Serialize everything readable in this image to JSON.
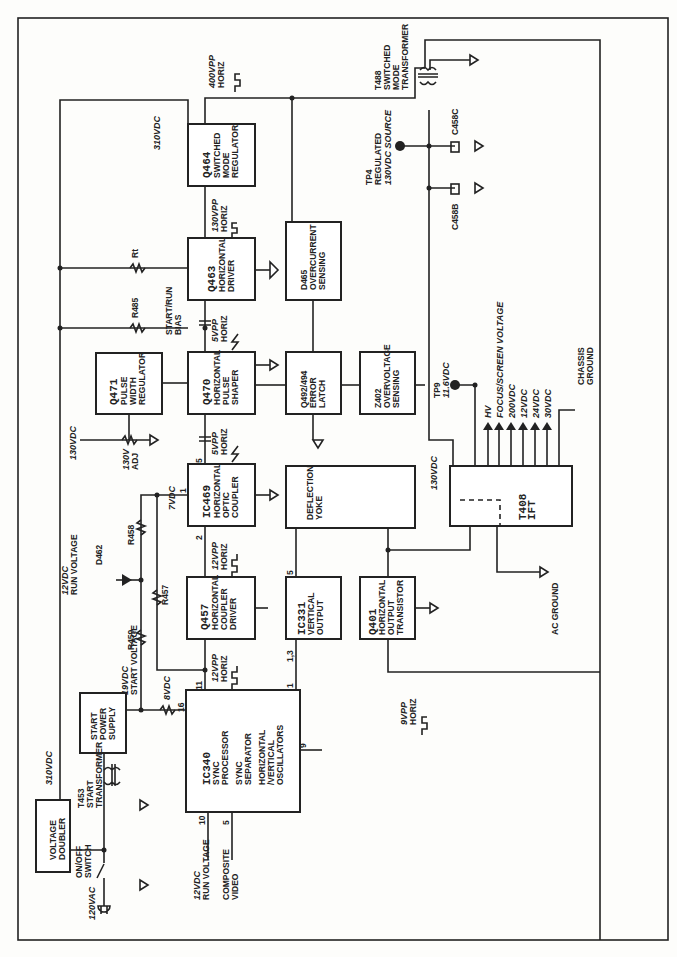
{
  "blocks": {
    "voltage_doubler": [
      "VOLTAGE",
      "DOUBLER"
    ],
    "start_power_supply": [
      "START",
      "POWER",
      "SUPPLY"
    ],
    "ic340": {
      "id": "IC340",
      "lines": [
        "SYNC",
        "PROCESSOR",
        "",
        "SYNC",
        "SEPARATOR",
        "",
        "HORIZONTAL",
        "/VERTICAL",
        "OSCILLATORS"
      ]
    },
    "q457": {
      "id": "Q457",
      "lines": [
        "HORIZONTAL",
        "COUPLER",
        "DRIVER"
      ]
    },
    "ic469": {
      "id": "IC469",
      "lines": [
        "HORIZONTAL",
        "OPTIC",
        "COUPLER"
      ]
    },
    "q471": {
      "id": "Q471",
      "lines": [
        "PULSE",
        "WIDTH",
        "REGULATOR"
      ]
    },
    "q470": {
      "id": "Q470",
      "lines": [
        "HORIZONTAL",
        "PULSE",
        "SHAPER"
      ]
    },
    "q463": {
      "id": "Q463",
      "lines": [
        "HORIZONTAL",
        "DRIVER"
      ]
    },
    "q464": {
      "id": "Q464",
      "lines": [
        "SWITCHED",
        "MODE",
        "REGULATOR"
      ]
    },
    "d465": {
      "id": "D465",
      "lines": [
        "OVERCURRENT",
        "SENSING"
      ]
    },
    "q492": {
      "id": "Q492/494",
      "lines": [
        "ERROR",
        "LATCH"
      ]
    },
    "z402": {
      "id": "Z402",
      "lines": [
        "OVERVOLTAGE",
        "SENSING"
      ]
    },
    "deflection_yoke": [
      "DEFLECTION",
      "YOKE"
    ],
    "ic331": {
      "id": "IC331",
      "lines": [
        "VERTICAL",
        "OUTPUT"
      ]
    },
    "q401": {
      "id": "Q401",
      "lines": [
        "HORIZONTAL",
        "OUTPUT",
        "TRANSISTOR"
      ]
    },
    "t408": {
      "id": "T408",
      "lines": [
        "IFT"
      ]
    }
  },
  "labels": {
    "ac_in": "120VAC",
    "on_off_switch": [
      "ON/OFF",
      "SWITCH"
    ],
    "t453": [
      "T453",
      "START",
      "TRANSFORMER"
    ],
    "v310_left": "310VDC",
    "v310_top": "310VDC",
    "run_voltage_12": [
      "12VDC",
      "RUN VOLTAGE"
    ],
    "d462": "D462",
    "r459": "R459",
    "r458": "R458",
    "r457": "R457",
    "start_voltage": [
      "19VDC",
      "START VOLTAGE"
    ],
    "v8": "8VDC",
    "v7": "7VDC",
    "v130_left": "130VDC",
    "adj_130": [
      "130V",
      "ADJ"
    ],
    "r485": "R485",
    "rt": "Rt",
    "start_run_bias": [
      "START/RUN",
      "BIAS"
    ],
    "in_run_voltage": [
      "12VDC",
      "RUN VOLTAGE"
    ],
    "in_composite": [
      "COMPOSITE",
      "VIDEO"
    ],
    "w_12vpp_a": [
      "12VPP",
      "HORIZ"
    ],
    "w_12vpp_b": [
      "12VPP",
      "HORIZ"
    ],
    "w_5vpp_a": [
      "5VPP",
      "HORIZ"
    ],
    "w_5vpp_b": [
      "5VPP",
      "HORIZ"
    ],
    "w_130vpp": [
      "130VPP",
      "HORIZ"
    ],
    "w_400vpp": [
      "400VPP",
      "HORIZ"
    ],
    "w_9vpp": [
      "9VPP",
      "HORIZ"
    ],
    "t488": [
      "T488",
      "SWITCHED",
      "MODE",
      "TRANSFORMER"
    ],
    "tp4": [
      "TP4",
      "REGULATED",
      "130VDC SOURCE"
    ],
    "c458c": "C458C",
    "c458b": "C458B",
    "tp9": [
      "TP9",
      "11.6VDC"
    ],
    "v130_ift": "130VDC",
    "outputs": [
      "HV",
      "FOCUS/SCREEN VOLTAGE",
      "200VDC",
      "12VDC",
      "24VDC",
      "30VDC"
    ],
    "chassis_ground": [
      "CHASSIS",
      "GROUND"
    ],
    "ac_ground": "AC GROUND"
  },
  "pins": {
    "ic340_16": "16",
    "ic340_11": "11",
    "ic340_10": "10",
    "ic340_5": "5",
    "ic340_1": "1",
    "ic340_9": "9",
    "ic331_13": "1,3",
    "ic331_5": "5",
    "ic469_1": "1",
    "ic469_2": "2",
    "ic469_5": "5"
  }
}
